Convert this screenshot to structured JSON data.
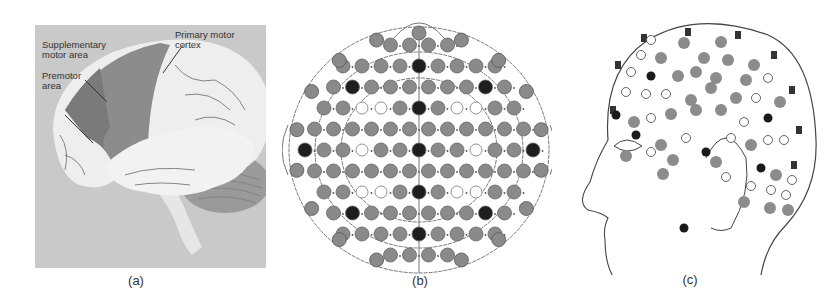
{
  "figure": {
    "panels": [
      {
        "id": "a",
        "caption": "(a)",
        "title": "Lateral view of the brain",
        "labels": [
          {
            "text": "Supplementary motor area",
            "lines": [
              "Supplementary",
              "motor area"
            ]
          },
          {
            "text": "Primary motor cortex",
            "lines": [
              "Primary motor",
              "cortex"
            ]
          },
          {
            "text": "Premotor area",
            "lines": [
              "Premotor",
              "area"
            ]
          }
        ],
        "colors": {
          "background": "#c9c9c9",
          "brain": "#eeeeee",
          "motor_region": "#8c8c8c",
          "premotor_region": "#7a7a7a",
          "cerebellum": "#9a9a9a"
        }
      },
      {
        "id": "b",
        "caption": "(b)",
        "title": "Top-down EEG electrode layout",
        "colors": {
          "dark": "#1e1e1e",
          "gray": "#8a8a8a",
          "outline": "#ffffff",
          "line": "#777777"
        }
      },
      {
        "id": "c",
        "caption": "(c)",
        "title": "Side-profile EEG electrode layout",
        "edge_labels": [
          "Fpz",
          "AFz",
          "Fz",
          "FCz",
          "Cz",
          "CPz",
          "Pz",
          "POz",
          "Oz"
        ],
        "inner_labels": [
          "F3",
          "C3",
          "P3",
          "FT7",
          "T7",
          "P7",
          "O1",
          "A1",
          "FPT1"
        ],
        "colors": {
          "dark": "#1a1a1a",
          "gray": "#8c8c8c",
          "outline": "#ffffff",
          "line": "#444444"
        }
      }
    ]
  }
}
